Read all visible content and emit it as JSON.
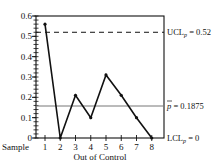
{
  "chart_data": {
    "type": "line",
    "title": "",
    "xlabel": "Out of Control",
    "x_prefix_label": "Sample",
    "ylabel": "",
    "x": [
      1,
      2,
      3,
      4,
      5,
      6,
      7,
      8
    ],
    "values": [
      0.56,
      0.0,
      0.21,
      0.1,
      0.31,
      0.21,
      0.1,
      0.0
    ],
    "ylim": [
      0,
      0.6
    ],
    "xlim": [
      0.4,
      8.8
    ],
    "y_ticks": [
      0,
      0.1,
      0.2,
      0.3,
      0.4,
      0.5,
      0.6
    ],
    "y_tick_labels": [
      "0",
      "0.1",
      "0.2",
      "0.3",
      "0.4",
      "0.5",
      "0.6"
    ],
    "x_tick_labels": [
      "1",
      "2",
      "3",
      "4",
      "5",
      "6",
      "7",
      "8"
    ],
    "minor_y_step": 0.02,
    "grid": false,
    "legend": null,
    "reference_lines": [
      {
        "name": "UCL",
        "label_main": "UCL",
        "label_sub": "p",
        "label_value": " = 0.52",
        "value": 0.52,
        "style": "dashed"
      },
      {
        "name": "center",
        "label_main": "p",
        "label_value": " = 0.1875",
        "overbar": true,
        "value": 0.1875,
        "style": "solid"
      },
      {
        "name": "LCL",
        "label_main": "LCL",
        "label_sub": "p",
        "label_value": " = 0",
        "value": 0,
        "style": "solid"
      }
    ],
    "colors": {
      "line": "#111111",
      "center_line": "#777777",
      "axis": "#111111"
    }
  }
}
